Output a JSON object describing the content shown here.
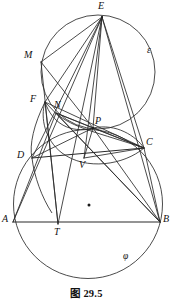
{
  "figure": {
    "caption": "图 29.5",
    "type": "euclidean-geometry-diagram",
    "stroke_color": "#2b2b2b",
    "background_color": "#ffffff",
    "canvas": {
      "width": 173,
      "height": 301
    }
  },
  "curve_labels": [
    {
      "id": "epsilon",
      "text": "ε",
      "x": 147,
      "y": 46
    },
    {
      "id": "phi",
      "text": "φ",
      "x": 123,
      "y": 252
    }
  ],
  "points": [
    {
      "id": "E",
      "label": "E",
      "x": 102,
      "y": 17,
      "label_x": 98,
      "label_y": 2
    },
    {
      "id": "M",
      "label": "M",
      "x": 41,
      "y": 62,
      "label_x": 25,
      "label_y": 51
    },
    {
      "id": "F",
      "label": "F",
      "x": 45,
      "y": 102,
      "label_x": 31,
      "label_y": 95
    },
    {
      "id": "N",
      "label": "N",
      "x": 56,
      "y": 113,
      "label_x": 55,
      "label_y": 101
    },
    {
      "id": "P",
      "label": "P",
      "x": 93,
      "y": 128,
      "label_x": 95,
      "label_y": 117
    },
    {
      "id": "C",
      "label": "C",
      "x": 144,
      "y": 148,
      "label_x": 146,
      "label_y": 138
    },
    {
      "id": "D",
      "label": "D",
      "x": 32,
      "y": 158,
      "label_x": 18,
      "label_y": 151
    },
    {
      "id": "V",
      "label": "V",
      "x": 84,
      "y": 158,
      "label_x": 80,
      "label_y": 160
    },
    {
      "id": "A",
      "label": "A",
      "x": 13,
      "y": 222,
      "label_x": 2,
      "label_y": 215
    },
    {
      "id": "B",
      "label": "B",
      "x": 160,
      "y": 222,
      "label_x": 162,
      "label_y": 215
    },
    {
      "id": "T",
      "label": "T",
      "x": 58,
      "y": 224,
      "label_x": 55,
      "label_y": 227
    },
    {
      "id": "O",
      "label": "",
      "x": 89,
      "y": 205,
      "label_x": 0,
      "label_y": 0
    }
  ],
  "circles": [
    {
      "id": "circle-phi",
      "cx": 88,
      "cy": 204,
      "r": 74.5
    },
    {
      "id": "circle-epsilon",
      "cx": 98,
      "cy": 72,
      "r": 57.0
    },
    {
      "id": "circle-small",
      "cx": 89,
      "cy": 165,
      "r": 55.0
    }
  ],
  "segments": [
    {
      "id": "seg-A-B",
      "from": "A",
      "to": "B"
    },
    {
      "id": "seg-D-C",
      "from": "D",
      "to": "C"
    },
    {
      "id": "seg-E-M",
      "from": "E",
      "to": "M"
    },
    {
      "id": "seg-E-F",
      "from": "E",
      "to": "F"
    },
    {
      "id": "seg-E-D",
      "from": "E",
      "to": "D"
    },
    {
      "id": "seg-E-A",
      "from": "E",
      "to": "A"
    },
    {
      "id": "seg-E-T",
      "from": "E",
      "to": "T"
    },
    {
      "id": "seg-E-V",
      "from": "E",
      "to": "V"
    },
    {
      "id": "seg-E-P",
      "from": "E",
      "to": "P"
    },
    {
      "id": "seg-E-C",
      "from": "E",
      "to": "C"
    },
    {
      "id": "seg-E-B",
      "from": "E",
      "to": "B"
    },
    {
      "id": "seg-M-P",
      "from": "M",
      "to": "P"
    },
    {
      "id": "seg-M-T",
      "from": "M",
      "to": "T"
    },
    {
      "id": "seg-F-T",
      "from": "F",
      "to": "T"
    },
    {
      "id": "seg-F-C",
      "from": "F",
      "to": "C"
    },
    {
      "id": "seg-F-B",
      "from": "F",
      "to": "B"
    },
    {
      "id": "seg-N-P",
      "from": "N",
      "to": "P"
    },
    {
      "id": "seg-N-C",
      "from": "N",
      "to": "C"
    },
    {
      "id": "seg-N-B",
      "from": "N",
      "to": "B"
    },
    {
      "id": "seg-D-P",
      "from": "D",
      "to": "P"
    },
    {
      "id": "seg-P-V",
      "from": "P",
      "to": "V"
    },
    {
      "id": "seg-P-B",
      "from": "P",
      "to": "B"
    },
    {
      "id": "seg-P-C",
      "from": "P",
      "to": "C"
    },
    {
      "id": "seg-V-C",
      "from": "V",
      "to": "C"
    },
    {
      "id": "seg-A-N",
      "from": "A",
      "to": "N"
    },
    {
      "id": "seg-C-B",
      "from": "C",
      "to": "B"
    }
  ]
}
